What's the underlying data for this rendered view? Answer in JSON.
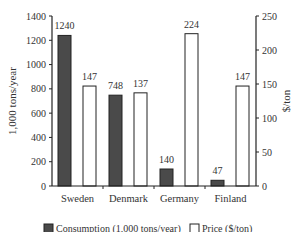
{
  "chart_data": {
    "type": "bar",
    "title": "",
    "categories": [
      "Sweden",
      "Denmark",
      "Germany",
      "Finland"
    ],
    "series": [
      {
        "name": "Consumption (1,000 tons/year)",
        "axis": "left",
        "values": [
          1240,
          748,
          140,
          47
        ],
        "color": "#4a4a4a"
      },
      {
        "name": "Price ($/ton)",
        "axis": "right",
        "values": [
          147,
          137,
          224,
          147
        ],
        "color": "#ffffff"
      }
    ],
    "ylabel": "1,000 tons/year",
    "ylim": [
      0,
      1400
    ],
    "yticks": [
      0,
      200,
      400,
      600,
      800,
      1000,
      1200,
      1400
    ],
    "y2label": "$/ton",
    "y2lim": [
      0,
      250
    ],
    "y2ticks": [
      0,
      50,
      100,
      150,
      200,
      250
    ],
    "grid": false,
    "legend_position": "bottom",
    "data_labels": true
  },
  "legend": {
    "consumption_label": "Consumption (1,000 tons/year)",
    "price_label": "Price ($/ton)"
  }
}
